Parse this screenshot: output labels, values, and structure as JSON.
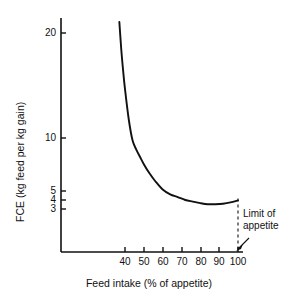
{
  "chart_data": {
    "type": "line",
    "title": "",
    "xlabel": "Feed intake (% of appetite)",
    "ylabel": "FCE (kg feed per kg gain)",
    "xlim": [
      30,
      103
    ],
    "ylim": [
      2.6,
      22
    ],
    "yscale": "log",
    "grid": false,
    "legend": "none",
    "xticks": [
      {
        "value": 40,
        "label": "40",
        "px": 125
      },
      {
        "value": 50,
        "label": "50",
        "px": 144
      },
      {
        "value": 60,
        "label": "60",
        "px": 163
      },
      {
        "value": 70,
        "label": "70",
        "px": 182
      },
      {
        "value": 80,
        "label": "80",
        "px": 201
      },
      {
        "value": 90,
        "label": "90",
        "px": 219
      },
      {
        "value": 100,
        "label": "100",
        "px": 238
      }
    ],
    "yticks": [
      {
        "value": 20,
        "label": "20",
        "px": 33
      },
      {
        "value": 10,
        "label": "10",
        "px": 138
      },
      {
        "value": 5,
        "label": "5",
        "px": 191
      },
      {
        "value": 4,
        "label": "4",
        "px": 200
      },
      {
        "value": 3,
        "label": "3",
        "px": 209
      }
    ],
    "series": [
      {
        "name": "FCE curve",
        "x": [
          37,
          38,
          39,
          40,
          42,
          44,
          46,
          48,
          50,
          53,
          56,
          60,
          64,
          68,
          72,
          76,
          80,
          84,
          88,
          92,
          96,
          100
        ],
        "y": [
          21.5,
          18.0,
          15.6,
          13.8,
          11.3,
          9.7,
          8.6,
          7.8,
          7.1,
          6.3,
          5.7,
          5.1,
          4.6,
          4.3,
          4.0,
          3.8,
          3.62,
          3.5,
          3.5,
          3.55,
          3.7,
          3.95
        ]
      }
    ],
    "annotations": [
      {
        "name": "limit-of-appetite",
        "lines": [
          "Limit of",
          "appetite"
        ],
        "marker": "dashed-vertical-line-with-arrow",
        "at_x": 100
      }
    ],
    "colors": {
      "curve": "#111111",
      "axis": "#111111",
      "background": "#ffffff",
      "annotation": "#111111"
    }
  }
}
